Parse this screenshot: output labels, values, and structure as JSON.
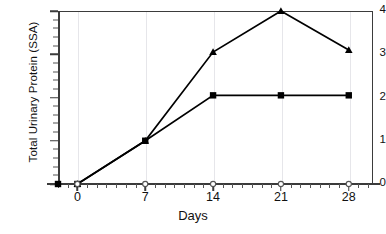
{
  "chart_data": {
    "type": "line",
    "title": "",
    "xlabel": "Days",
    "ylabel": "Total Urinary Protein (SSA)",
    "x": [
      0,
      7,
      14,
      21,
      28
    ],
    "xlim": [
      -2,
      30.5
    ],
    "ylim": [
      0,
      4
    ],
    "xticks": [
      0,
      7,
      14,
      21,
      28
    ],
    "xtick_labels": [
      "0",
      "7",
      "14",
      "21",
      "28"
    ],
    "yticks": [
      0,
      1,
      2,
      3,
      4
    ],
    "ytick_labels": [
      "0",
      "1",
      "2",
      "3",
      "4"
    ],
    "grid": "vertical-faint",
    "legend": "none",
    "series": [
      {
        "name": "series-triangle",
        "marker": "triangle-filled",
        "color": "#000000",
        "values": [
          0,
          1.0,
          3.05,
          4.0,
          3.1
        ]
      },
      {
        "name": "series-square",
        "marker": "square-filled",
        "color": "#000000",
        "values": [
          0,
          1.0,
          2.05,
          2.05,
          2.05
        ]
      },
      {
        "name": "series-open-circle",
        "marker": "circle-open",
        "color": "#555555",
        "values": [
          0,
          0,
          0,
          0,
          0
        ]
      }
    ]
  }
}
